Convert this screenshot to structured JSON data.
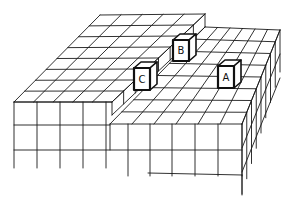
{
  "figure": {
    "line_color": "#1a1a1a",
    "background_color": "#ffffff"
  },
  "cubes": [
    {
      "id": "A",
      "label": "A",
      "tier": "lower"
    },
    {
      "id": "B",
      "label": "B",
      "tier": "lower"
    },
    {
      "id": "C",
      "label": "C",
      "tier": "lower"
    }
  ]
}
